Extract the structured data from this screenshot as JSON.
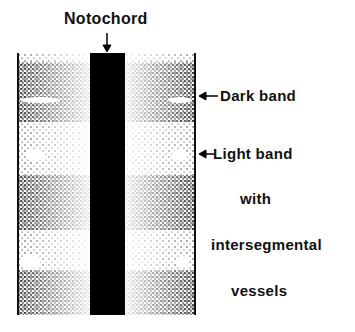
{
  "labels": {
    "notochord": "Notochord",
    "dark_band": "Dark band",
    "light_band": "Light band",
    "with": "with",
    "intersegmental": "intersegmental",
    "vessels": "vessels"
  },
  "colors": {
    "ink": "#000000",
    "background": "#ffffff"
  },
  "bands": [
    {
      "type": "dark",
      "y": 70
    },
    {
      "type": "light",
      "y": 150
    },
    {
      "type": "dark",
      "y": 200
    },
    {
      "type": "light",
      "y": 255
    },
    {
      "type": "dark",
      "y": 300
    }
  ]
}
